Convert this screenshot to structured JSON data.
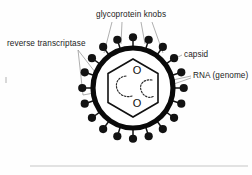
{
  "figure": {
    "background_color": "#fefefe",
    "ink_color": "#111111",
    "leader_color": "#8d8d8d"
  },
  "labels": {
    "glycoprotein_knobs": "glycoprotein knobs",
    "reverse_transcriptase": "reverse transcriptase",
    "capsid": "capsid",
    "rna_genome": "RNA (genome)"
  },
  "structures": {
    "envelope": {
      "name": "envelope",
      "shape": "circle",
      "cx": 133,
      "cy": 88,
      "r": 40,
      "stroke_width": 5.2,
      "color": "#0a0a0a"
    },
    "capsid": {
      "name": "capsid",
      "shape": "hexagon",
      "cx": 133,
      "cy": 88,
      "r": 29,
      "stroke_width": 1.6,
      "color": "#111111"
    },
    "glycoprotein_knobs": {
      "name": "glycoprotein-knobs",
      "count": 20,
      "head_radius": 4.1,
      "stalk_length": 8.5,
      "color": "#121212"
    },
    "rna_strands": {
      "name": "rna-strands",
      "count": 2,
      "style": "dashed",
      "color": "#2a2a2a"
    },
    "genome_marks": {
      "name": "genome-o-marks",
      "glyphs": [
        "O",
        "O"
      ],
      "count": 2
    }
  },
  "callouts": [
    {
      "id": "glycoprotein-knobs",
      "label": "glycoprotein knobs",
      "text_x": 96,
      "text_y": 17,
      "anchor": "start",
      "leader_count": 4
    },
    {
      "id": "reverse-transcriptase",
      "label": "reverse transcriptase",
      "text_x": 7,
      "text_y": 46,
      "anchor": "start",
      "leader_count": 2
    },
    {
      "id": "capsid",
      "label": "capsid",
      "text_x": 184,
      "text_y": 57,
      "anchor": "start",
      "leader_count": 1
    },
    {
      "id": "rna-genome",
      "label": "RNA (genome)",
      "text_x": 193,
      "text_y": 78,
      "anchor": "start",
      "leader_count": 2
    }
  ]
}
